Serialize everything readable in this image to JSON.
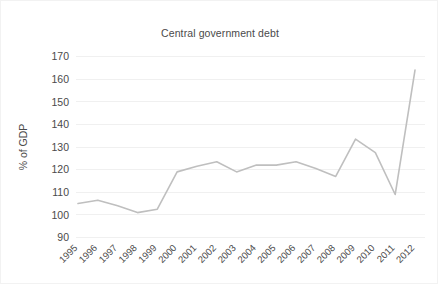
{
  "chart_data": {
    "type": "line",
    "title": "Central government debt",
    "xlabel": "",
    "ylabel": "% of GDP",
    "categories": [
      "1995",
      "1996",
      "1997",
      "1998",
      "1999",
      "2000",
      "2001",
      "2002",
      "2003",
      "2004",
      "2005",
      "2006",
      "2007",
      "2008",
      "2009",
      "2010",
      "2011",
      "2012"
    ],
    "values": [
      105,
      106.5,
      104,
      101,
      102.5,
      119,
      121.5,
      123.5,
      119,
      122,
      122,
      123.5,
      120.5,
      117,
      133.5,
      127.5,
      109,
      164
    ],
    "series": [
      {
        "name": "Central government debt",
        "values": [
          105,
          106.5,
          104,
          101,
          102.5,
          119,
          121.5,
          123.5,
          119,
          122,
          122,
          123.5,
          120.5,
          117,
          133.5,
          127.5,
          109,
          164
        ]
      }
    ],
    "ylim": [
      90,
      170
    ],
    "ytick_labels": [
      "90",
      "100",
      "110",
      "120",
      "130",
      "140",
      "150",
      "160",
      "170"
    ],
    "ytick_values": [
      90,
      100,
      110,
      120,
      130,
      140,
      150,
      160,
      170
    ],
    "grid": true,
    "legend": "none",
    "line_color": "#bfbfbf"
  }
}
